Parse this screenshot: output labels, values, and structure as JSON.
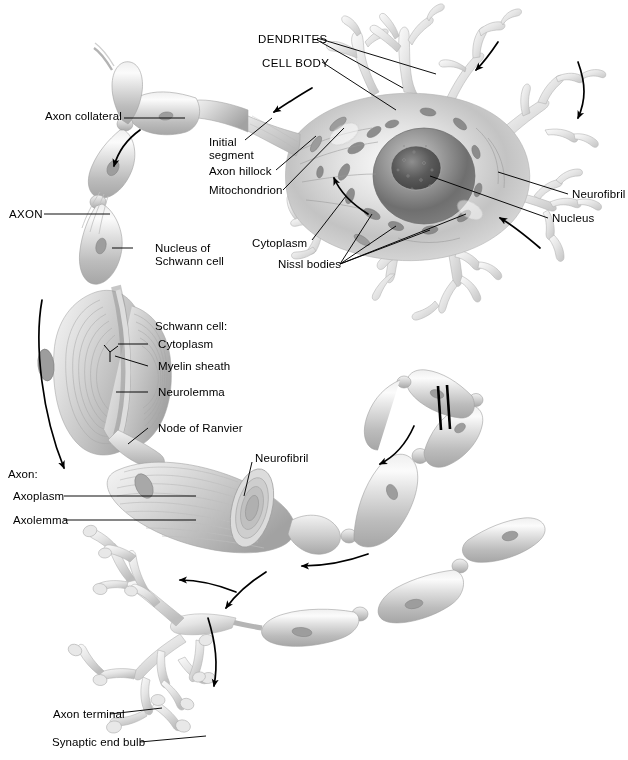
{
  "figure": {
    "background_color": "#ffffff",
    "ink_color": "#000000",
    "illustration_style": "grayscale airbrush anatomical illustration"
  },
  "labels": {
    "dendrites": "DENDRITES",
    "cell_body": "CELL BODY",
    "axon": "AXON",
    "axon_collateral": "Axon collateral",
    "initial_segment_line1": "Initial",
    "initial_segment_line2": "segment",
    "axon_hillock": "Axon hillock",
    "mitochondrion": "Mitochondrion",
    "cytoplasm_soma": "Cytoplasm",
    "nissl_bodies": "Nissl bodies",
    "neurofibril_soma": "Neurofibril",
    "nucleus": "Nucleus",
    "nucleus_of_schwann_cell_line1": "Nucleus of",
    "nucleus_of_schwann_cell_line2": "Schwann cell",
    "schwann_cell_heading": "Schwann cell:",
    "schwann_cytoplasm": "Cytoplasm",
    "myelin_sheath": "Myelin sheath",
    "neurolemma": "Neurolemma",
    "node_of_ranvier": "Node of Ranvier",
    "neurofibril_axon": "Neurofibril",
    "axon_heading": "Axon:",
    "axoplasm": "Axoplasm",
    "axolemma": "Axolemma",
    "axon_terminal": "Axon terminal",
    "synaptic_end_bulb": "Synaptic end bulb"
  },
  "structures": [
    {
      "name": "cell-body",
      "description": "large soma with nucleus, nucleolus, Nissl bodies, mitochondria, neurofibrils"
    },
    {
      "name": "dendrites",
      "description": "many branching tapered processes radiating from the soma"
    },
    {
      "name": "axon-hillock",
      "description": "cone-shaped origin of the axon on the soma"
    },
    {
      "name": "initial-segment",
      "description": "unmyelinated first portion of the axon"
    },
    {
      "name": "axon-collateral",
      "description": "side branch of the axon"
    },
    {
      "name": "myelin-sheath",
      "description": "segmented Schwann cell wrapping along the axon"
    },
    {
      "name": "node-of-ranvier",
      "description": "gap between adjacent myelin segments"
    },
    {
      "name": "unrolled-myelin",
      "description": "cut-away showing concentric myelin lamellae and neurolemma"
    },
    {
      "name": "axon-terminal",
      "description": "terminal arborization with synaptic end bulbs"
    }
  ],
  "flow_arrows": {
    "count": 8,
    "meaning": "direction of nerve impulse propagation from dendrites to synaptic end bulbs"
  },
  "break_marks": {
    "count": 1,
    "meaning": "double slash indicating the axon is shortened"
  },
  "colors": {
    "ink": "#000000",
    "paper": "#ffffff",
    "tissue_light": "#f0f0f0",
    "tissue_mid": "#c8c8c8",
    "tissue_dark": "#8a8a8a",
    "nucleus_dark": "#5a5a5a"
  }
}
